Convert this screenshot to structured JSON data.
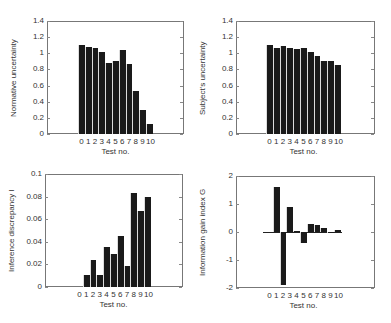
{
  "chart_data": [
    {
      "type": "bar",
      "categories": [
        "0",
        "1",
        "2",
        "3",
        "4",
        "5",
        "6",
        "7",
        "8",
        "9",
        "10"
      ],
      "values": [
        1.1,
        1.08,
        1.06,
        1.02,
        0.88,
        0.91,
        1.04,
        0.87,
        0.53,
        0.3,
        0.12
      ],
      "title": "",
      "xlabel": "Test no.",
      "ylabel": "Normative uncertainty",
      "ylim": [
        0,
        1.4
      ],
      "yticks": [
        "0",
        "0.2",
        "0.4",
        "0.6",
        "0.8",
        "1",
        "1.2",
        "1.4"
      ],
      "grid": false
    },
    {
      "type": "bar",
      "categories": [
        "0",
        "1",
        "2",
        "3",
        "4",
        "5",
        "6",
        "7",
        "8",
        "9",
        "10"
      ],
      "values": [
        1.1,
        1.07,
        1.09,
        1.06,
        1.05,
        1.07,
        1.01,
        0.97,
        0.91,
        0.9,
        0.86
      ],
      "title": "",
      "xlabel": "Test no.",
      "ylabel": "Subject's uncertainty",
      "ylim": [
        0,
        1.4
      ],
      "yticks": [
        "0",
        "0.2",
        "0.4",
        "0.6",
        "0.8",
        "1",
        "1.2",
        "1.4"
      ],
      "grid": false
    },
    {
      "type": "bar",
      "categories": [
        "0",
        "1",
        "2",
        "3",
        "4",
        "5",
        "6",
        "7",
        "8",
        "9",
        "10"
      ],
      "values": [
        0,
        0.011,
        0.024,
        0.011,
        0.035,
        0.029,
        0.045,
        0.019,
        0.083,
        0.067,
        0.08
      ],
      "title": "",
      "xlabel": "Test no.",
      "ylabel": "Inference discrepancy I",
      "ylim": [
        0,
        0.1
      ],
      "yticks": [
        "0",
        "0.02",
        "0.04",
        "0.06",
        "0.08",
        "0.1"
      ],
      "grid": false
    },
    {
      "type": "bar",
      "categories": [
        "0",
        "1",
        "2",
        "3",
        "4",
        "5",
        "6",
        "7",
        "8",
        "9",
        "10"
      ],
      "values": [
        0,
        1.6,
        -1.9,
        0.9,
        0.05,
        -0.4,
        0.3,
        0.25,
        0.15,
        -0.03,
        0.08
      ],
      "title": "",
      "xlabel": "Test no.",
      "ylabel": "Information gain index G",
      "ylim": [
        -2,
        2
      ],
      "yticks": [
        "-2",
        "-1",
        "0",
        "1",
        "2"
      ],
      "grid": false
    }
  ]
}
